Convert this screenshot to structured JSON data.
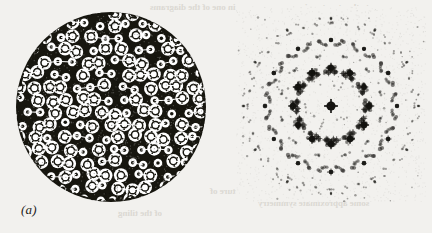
{
  "figure": {
    "background_color": "#f2f1ee",
    "ink_color": "#1d1c1a",
    "ghost_text_color": "#d8d5cf",
    "panels": [
      {
        "id": "a",
        "label": "(a)",
        "kind": "quasicrystal-tiling-disk",
        "description": "Circular patch of a decorated quasiperiodic tiling built from ring-shaped atomic clusters"
      },
      {
        "id": "b",
        "label": "(b)",
        "kind": "diffraction-pattern",
        "description": "Fourier transform of panel (a) showing quasiperiodic Bragg peaks of varying intensity"
      }
    ],
    "ghost_text": [
      {
        "text": "in one of the diagrams",
        "x": 150,
        "y": 2,
        "size": 9
      },
      {
        "text": "to the structure in",
        "x": 300,
        "y": 2,
        "size": 9
      },
      {
        "text": "as shown by the",
        "x": 252,
        "y": 13,
        "size": 9
      },
      {
        "text": "a tiling of the plane",
        "x": 330,
        "y": 13,
        "size": 9
      },
      {
        "text": "the structure of",
        "x": 210,
        "y": 186,
        "size": 9
      },
      {
        "text": "some approximate symmetry",
        "x": 258,
        "y": 198,
        "size": 9
      },
      {
        "text": "and the",
        "x": 80,
        "y": 186,
        "size": 9
      },
      {
        "text": "of the tiling",
        "x": 118,
        "y": 208,
        "size": 9
      }
    ]
  },
  "chart_data": {
    "type": "scatter",
    "title": "",
    "xlabel": "",
    "ylabel": "",
    "grid": false,
    "legend": null,
    "panel_a": {
      "type": "tiling",
      "shape": "disk",
      "center": [
        95,
        95
      ],
      "radius": 95,
      "symmetry_order": 12,
      "motif": "ring-cluster",
      "motif_radius_large": 7.0,
      "motif_radius_small": 3.2,
      "lattice_spacing": 14.5,
      "inflation_ratio": 1.732,
      "ink_coverage": 0.46,
      "note": "Dense packing of large and small decorated rings forming a quasiperiodic pattern with rows of aligned clusters"
    },
    "panel_b": {
      "type": "scatter",
      "center": [
        95,
        100
      ],
      "symmetry_order": 12,
      "intensity_scale": "spot area proportional to Bragg intensity",
      "xlim": [
        0,
        190
      ],
      "ylim": [
        0,
        196
      ],
      "peaks": [
        {
          "x": 95,
          "y": 100,
          "r": 4.6,
          "i": 1.0
        },
        {
          "x": 95,
          "y": 62,
          "r": 3.2,
          "i": 0.62
        },
        {
          "x": 95,
          "y": 138,
          "r": 3.1,
          "i": 0.6
        },
        {
          "x": 57,
          "y": 100,
          "r": 2.2,
          "i": 0.36
        },
        {
          "x": 133,
          "y": 100,
          "r": 2.3,
          "i": 0.38
        },
        {
          "x": 76,
          "y": 72,
          "r": 2.6,
          "i": 0.45
        },
        {
          "x": 116,
          "y": 73,
          "r": 2.5,
          "i": 0.44
        },
        {
          "x": 75,
          "y": 128,
          "r": 2.6,
          "i": 0.45
        },
        {
          "x": 117,
          "y": 127,
          "r": 2.5,
          "i": 0.43
        },
        {
          "x": 60,
          "y": 82,
          "r": 1.8,
          "i": 0.26
        },
        {
          "x": 131,
          "y": 84,
          "r": 1.9,
          "i": 0.27
        },
        {
          "x": 61,
          "y": 118,
          "r": 1.8,
          "i": 0.26
        },
        {
          "x": 130,
          "y": 117,
          "r": 1.9,
          "i": 0.28
        },
        {
          "x": 95,
          "y": 34,
          "r": 2.2,
          "i": 0.34
        },
        {
          "x": 95,
          "y": 166,
          "r": 2.0,
          "i": 0.31
        },
        {
          "x": 29,
          "y": 100,
          "r": 2.1,
          "i": 0.33
        },
        {
          "x": 161,
          "y": 100,
          "r": 2.2,
          "i": 0.35
        },
        {
          "x": 46,
          "y": 57,
          "r": 2.0,
          "i": 0.3
        },
        {
          "x": 145,
          "y": 58,
          "r": 2.0,
          "i": 0.3
        },
        {
          "x": 45,
          "y": 143,
          "r": 2.0,
          "i": 0.3
        },
        {
          "x": 146,
          "y": 142,
          "r": 1.9,
          "i": 0.29
        },
        {
          "x": 70,
          "y": 44,
          "r": 1.7,
          "i": 0.23
        },
        {
          "x": 121,
          "y": 45,
          "r": 1.7,
          "i": 0.23
        },
        {
          "x": 69,
          "y": 156,
          "r": 1.6,
          "i": 0.22
        },
        {
          "x": 122,
          "y": 155,
          "r": 1.7,
          "i": 0.23
        },
        {
          "x": 38,
          "y": 76,
          "r": 1.6,
          "i": 0.21
        },
        {
          "x": 153,
          "y": 77,
          "r": 1.6,
          "i": 0.21
        },
        {
          "x": 37,
          "y": 124,
          "r": 1.6,
          "i": 0.21
        },
        {
          "x": 154,
          "y": 123,
          "r": 1.5,
          "i": 0.2
        },
        {
          "x": 84,
          "y": 50,
          "r": 1.3,
          "i": 0.15
        },
        {
          "x": 107,
          "y": 51,
          "r": 1.3,
          "i": 0.15
        },
        {
          "x": 83,
          "y": 150,
          "r": 1.3,
          "i": 0.15
        },
        {
          "x": 108,
          "y": 149,
          "r": 1.2,
          "i": 0.14
        },
        {
          "x": 18,
          "y": 72,
          "r": 1.2,
          "i": 0.13
        },
        {
          "x": 173,
          "y": 73,
          "r": 1.2,
          "i": 0.13
        },
        {
          "x": 17,
          "y": 128,
          "r": 1.2,
          "i": 0.13
        },
        {
          "x": 174,
          "y": 127,
          "r": 1.1,
          "i": 0.12
        },
        {
          "x": 95,
          "y": 12,
          "r": 1.3,
          "i": 0.15
        },
        {
          "x": 95,
          "y": 188,
          "r": 1.2,
          "i": 0.13
        },
        {
          "x": 8,
          "y": 100,
          "r": 1.2,
          "i": 0.13
        },
        {
          "x": 182,
          "y": 100,
          "r": 1.2,
          "i": 0.13
        },
        {
          "x": 53,
          "y": 28,
          "r": 1.1,
          "i": 0.12
        },
        {
          "x": 138,
          "y": 29,
          "r": 1.1,
          "i": 0.12
        },
        {
          "x": 52,
          "y": 172,
          "r": 1.0,
          "i": 0.1
        },
        {
          "x": 139,
          "y": 171,
          "r": 1.0,
          "i": 0.1
        },
        {
          "x": 26,
          "y": 46,
          "r": 1.0,
          "i": 0.1
        },
        {
          "x": 165,
          "y": 47,
          "r": 1.0,
          "i": 0.1
        },
        {
          "x": 25,
          "y": 154,
          "r": 1.0,
          "i": 0.1
        },
        {
          "x": 166,
          "y": 153,
          "r": 0.9,
          "i": 0.09
        }
      ]
    }
  }
}
